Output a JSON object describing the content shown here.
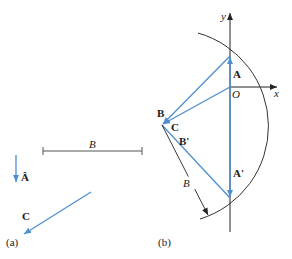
{
  "colors": {
    "vector": "#4f8fcf",
    "line": "#333333",
    "text": "#1a1a1a"
  },
  "panel_a": {
    "caption": "(a)",
    "unit_vector_label": "Â",
    "segment_label": "B",
    "vector_c_label": "C"
  },
  "panel_b": {
    "caption": "(b)",
    "axis_y_label": "y",
    "axis_x_label": "x",
    "origin_label": "O",
    "vector_a_label": "A",
    "vector_a_prime_label": "A'",
    "point_b_label": "B",
    "vector_c_label": "C",
    "vector_b_prime_label": "B'",
    "radius_label": "B"
  }
}
